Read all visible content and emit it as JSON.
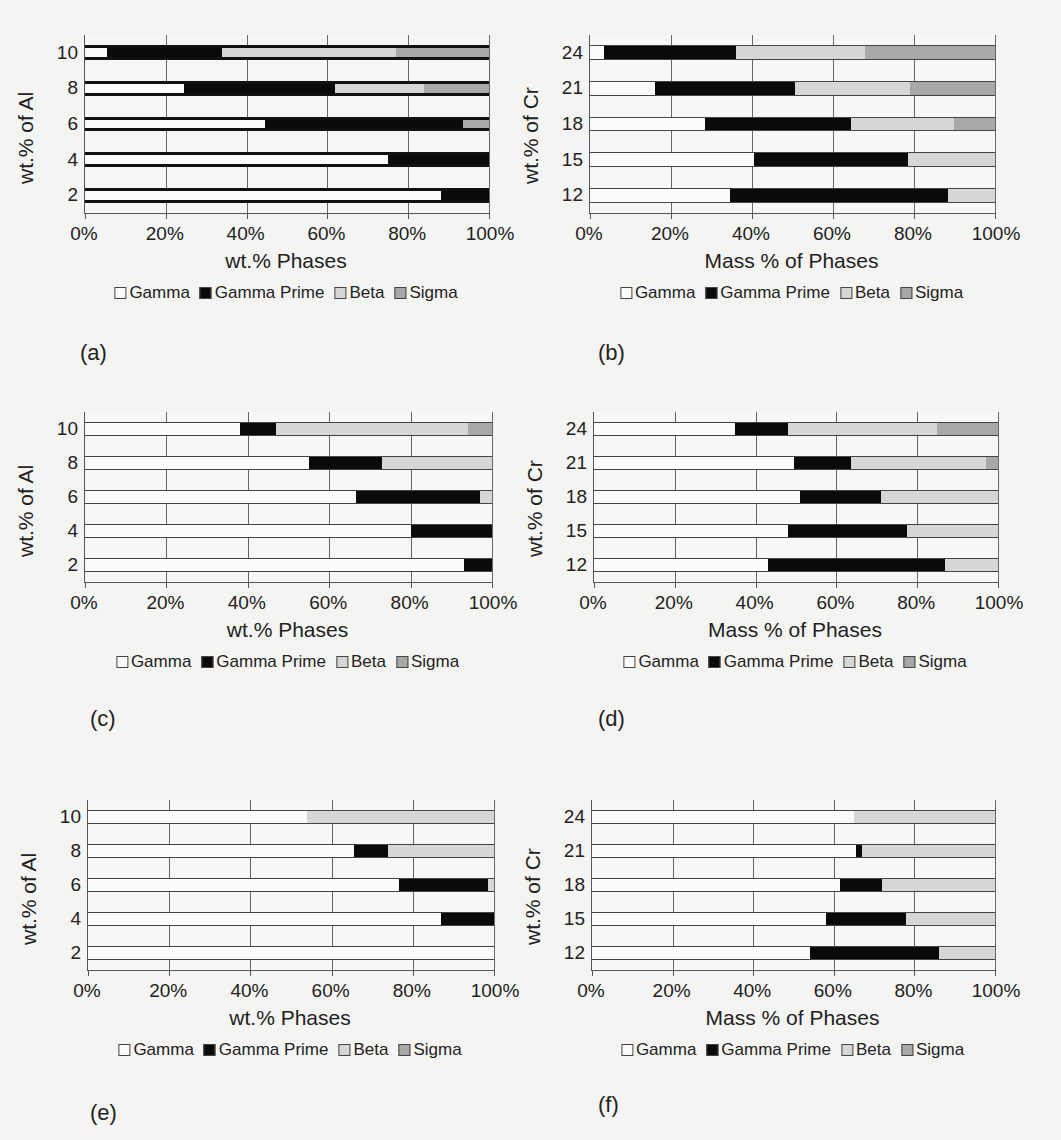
{
  "legend": [
    {
      "key": "gamma",
      "label": "Gamma",
      "color": "#fbfbfa"
    },
    {
      "key": "gp",
      "label": "Gamma Prime",
      "color": "#0a0a0a"
    },
    {
      "key": "beta",
      "label": "Beta",
      "color": "#d6d6d6"
    },
    {
      "key": "sigma",
      "label": "Sigma",
      "color": "#a8a8a8"
    }
  ],
  "x_ticks": [
    "0%",
    "20%",
    "40%",
    "60%",
    "80%",
    "100%"
  ],
  "chart_data": [
    {
      "panel": "(a)",
      "type": "bar",
      "stacked": true,
      "orientation": "horizontal",
      "ylabel": "wt.% of Al",
      "xlabel": "wt.% Phases",
      "xlim": [
        0,
        100
      ],
      "grid": true,
      "legend_position": "bottom",
      "categories": [
        "10",
        "8",
        "6",
        "4",
        "2"
      ],
      "series": [
        {
          "name": "Gamma",
          "values": [
            5.5,
            24.5,
            44.5,
            75,
            88
          ]
        },
        {
          "name": "Gamma Prime",
          "values": [
            28.5,
            37.5,
            49,
            25,
            12
          ]
        },
        {
          "name": "Beta",
          "values": [
            43,
            22,
            0,
            0,
            0
          ]
        },
        {
          "name": "Sigma",
          "values": [
            23,
            16,
            6.5,
            0,
            0
          ]
        }
      ]
    },
    {
      "panel": "(b)",
      "type": "bar",
      "stacked": true,
      "orientation": "horizontal",
      "ylabel": "wt.% of Cr",
      "xlabel": "Mass % of Phases",
      "xlim": [
        0,
        100
      ],
      "grid": true,
      "legend_position": "bottom",
      "categories": [
        "24",
        "21",
        "18",
        "15",
        "12"
      ],
      "series": [
        {
          "name": "Gamma",
          "values": [
            3.5,
            16,
            28.5,
            40.5,
            34.5
          ]
        },
        {
          "name": "Gamma Prime",
          "values": [
            32.5,
            34.5,
            36,
            38,
            54
          ]
        },
        {
          "name": "Beta",
          "values": [
            32,
            28.5,
            25.5,
            21.5,
            11.5
          ]
        },
        {
          "name": "Sigma",
          "values": [
            32,
            21,
            10,
            0,
            0
          ]
        }
      ]
    },
    {
      "panel": "(c)",
      "type": "bar",
      "stacked": true,
      "orientation": "horizontal",
      "ylabel": "wt.% of Al",
      "xlabel": "wt.% Phases",
      "xlim": [
        0,
        100
      ],
      "grid": true,
      "legend_position": "bottom",
      "categories": [
        "10",
        "8",
        "6",
        "4",
        "2"
      ],
      "series": [
        {
          "name": "Gamma",
          "values": [
            38,
            55,
            66.5,
            80,
            93
          ]
        },
        {
          "name": "Gamma Prime",
          "values": [
            9,
            18,
            30.5,
            20,
            7
          ]
        },
        {
          "name": "Beta",
          "values": [
            47,
            27,
            3,
            0,
            0
          ]
        },
        {
          "name": "Sigma",
          "values": [
            6,
            0,
            0,
            0,
            0
          ]
        }
      ]
    },
    {
      "panel": "(d)",
      "type": "bar",
      "stacked": true,
      "orientation": "horizontal",
      "ylabel": "wt.% of Cr",
      "xlabel": "Mass % of Phases",
      "xlim": [
        0,
        100
      ],
      "grid": true,
      "legend_position": "bottom",
      "categories": [
        "24",
        "21",
        "18",
        "15",
        "12"
      ],
      "series": [
        {
          "name": "Gamma",
          "values": [
            35,
            49.5,
            51,
            48,
            43
          ]
        },
        {
          "name": "Gamma Prime",
          "values": [
            13,
            14,
            20,
            29.5,
            44
          ]
        },
        {
          "name": "Beta",
          "values": [
            37,
            33.5,
            29,
            22.5,
            13
          ]
        },
        {
          "name": "Sigma",
          "values": [
            15,
            3,
            0,
            0,
            0
          ]
        }
      ]
    },
    {
      "panel": "(e)",
      "type": "bar",
      "stacked": true,
      "orientation": "horizontal",
      "ylabel": "wt.% of Al",
      "xlabel": "wt.% Phases",
      "xlim": [
        0,
        100
      ],
      "grid": true,
      "legend_position": "bottom",
      "categories": [
        "10",
        "8",
        "6",
        "4",
        "2"
      ],
      "series": [
        {
          "name": "Gamma",
          "values": [
            54,
            65.5,
            76.5,
            87,
            100
          ]
        },
        {
          "name": "Gamma Prime",
          "values": [
            0,
            8.5,
            22,
            13,
            0
          ]
        },
        {
          "name": "Beta",
          "values": [
            46,
            26,
            1.5,
            0,
            0
          ]
        },
        {
          "name": "Sigma",
          "values": [
            0,
            0,
            0,
            0,
            0
          ]
        }
      ]
    },
    {
      "panel": "(f)",
      "type": "bar",
      "stacked": true,
      "orientation": "horizontal",
      "ylabel": "wt.% of Cr",
      "xlabel": "Mass % of Phases",
      "xlim": [
        0,
        100
      ],
      "grid": true,
      "legend_position": "bottom",
      "categories": [
        "24",
        "21",
        "18",
        "15",
        "12"
      ],
      "series": [
        {
          "name": "Gamma",
          "values": [
            65,
            65.5,
            61.5,
            58,
            54
          ]
        },
        {
          "name": "Gamma Prime",
          "values": [
            0,
            1.5,
            10.5,
            20,
            32
          ]
        },
        {
          "name": "Beta",
          "values": [
            35,
            33,
            28,
            22,
            14
          ]
        },
        {
          "name": "Sigma",
          "values": [
            0,
            0,
            0,
            0,
            0
          ]
        }
      ]
    }
  ]
}
